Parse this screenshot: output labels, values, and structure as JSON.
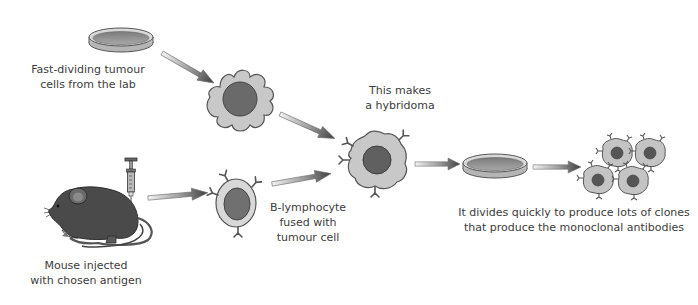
{
  "diagram": {
    "labels": {
      "tumour_cells": [
        "Fast-dividing tumour",
        "cells from the lab"
      ],
      "mouse": [
        "Mouse injected",
        "with chosen antigen"
      ],
      "b_lymphocyte": [
        "B-lymphocyte",
        "fused with",
        "tumour cell"
      ],
      "hybridoma": [
        "This makes",
        "a hybridoma"
      ],
      "clones": [
        "It divides quickly to produce lots of clones",
        "that produce the monoclonal antibodies"
      ]
    },
    "nodes": [
      {
        "id": "petri-dish-tumour",
        "type": "petri-dish"
      },
      {
        "id": "tumour-cell",
        "type": "cell"
      },
      {
        "id": "mouse",
        "type": "animal"
      },
      {
        "id": "syringe",
        "type": "syringe"
      },
      {
        "id": "b-lymphocyte",
        "type": "cell"
      },
      {
        "id": "hybridoma-cell",
        "type": "cell"
      },
      {
        "id": "petri-dish-culture",
        "type": "petri-dish"
      },
      {
        "id": "clone-cells",
        "type": "cell-group",
        "count": 4
      }
    ],
    "edges": [
      {
        "from": "petri-dish-tumour",
        "to": "tumour-cell"
      },
      {
        "from": "tumour-cell",
        "to": "hybridoma-cell"
      },
      {
        "from": "mouse",
        "to": "b-lymphocyte"
      },
      {
        "from": "b-lymphocyte",
        "to": "hybridoma-cell"
      },
      {
        "from": "hybridoma-cell",
        "to": "petri-dish-culture"
      },
      {
        "from": "petri-dish-culture",
        "to": "clone-cells"
      }
    ],
    "colors": {
      "cell_fill": "#c8c8c8",
      "nucleus_fill": "#6a6a6a",
      "outline": "#555555",
      "mouse_fill": "#4a4a4a",
      "arrow_light": "#e8e8e8",
      "arrow_dark": "#4a4a4a"
    }
  }
}
